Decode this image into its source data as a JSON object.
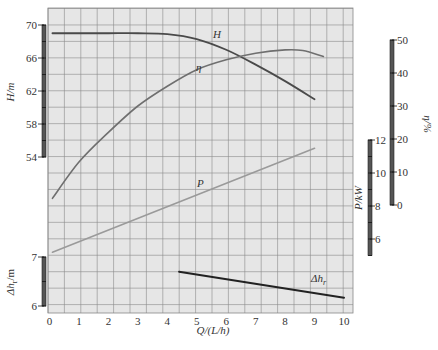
{
  "chart_data": {
    "type": "line",
    "title": "",
    "xlabel": "Q/(L/h)",
    "xlim": [
      0,
      10
    ],
    "xticks": [
      0,
      1,
      2,
      3,
      4,
      5,
      6,
      7,
      8,
      9,
      10
    ],
    "grid": true,
    "legend": "inline curve labels",
    "axes": {
      "H": {
        "label": "H/m",
        "side": "left",
        "range": [
          54,
          70
        ],
        "ticks": [
          54,
          58,
          62,
          66,
          70
        ]
      },
      "eta": {
        "label": "η/%",
        "side": "right",
        "range": [
          0,
          50
        ],
        "ticks": [
          0,
          10,
          20,
          30,
          40,
          50
        ]
      },
      "P": {
        "label": "P/kW",
        "side": "right-inner",
        "range": [
          5,
          12
        ],
        "ticks": [
          6,
          8,
          10,
          12
        ]
      },
      "dh": {
        "label": "Δh_r/m",
        "side": "left-lower",
        "range": [
          6,
          7
        ],
        "ticks": [
          6,
          7
        ]
      }
    },
    "series": [
      {
        "name": "H",
        "axis": "H",
        "color": "#4a4a4a",
        "x": [
          0.1,
          1,
          2,
          3,
          4,
          5,
          6,
          7,
          8,
          9.0
        ],
        "y": [
          69.0,
          69.0,
          69.0,
          69.0,
          68.9,
          68.3,
          67.0,
          65.2,
          63.2,
          61.0
        ]
      },
      {
        "name": "η",
        "axis": "eta",
        "color": "#6f6f6f",
        "x": [
          0.1,
          1,
          2,
          3,
          4,
          5,
          6,
          7,
          8,
          8.6,
          9.3
        ],
        "y": [
          2,
          13,
          22,
          30,
          36,
          41,
          44,
          46,
          47,
          46.8,
          45
        ]
      },
      {
        "name": "P",
        "axis": "P",
        "color": "#9a9a9a",
        "x": [
          0.1,
          9.0
        ],
        "y": [
          5.2,
          11.5
        ]
      },
      {
        "name": "Δh_r",
        "axis": "dh",
        "color": "#222222",
        "x": [
          4.4,
          10.0
        ],
        "y": [
          6.7,
          6.17
        ]
      }
    ]
  },
  "labels": {
    "x_axis_title": "Q/(L/h)",
    "H_axis_title": "H/m",
    "eta_axis_title": "η/%",
    "P_axis_title": "P/kW",
    "dh_axis_title": "Δh",
    "dh_axis_sub": "r",
    "dh_axis_unit": "/m",
    "curve_H": "H",
    "curve_eta": "η",
    "curve_P": "P",
    "curve_dh": "Δh",
    "curve_dh_sub": "r"
  },
  "caption": ""
}
